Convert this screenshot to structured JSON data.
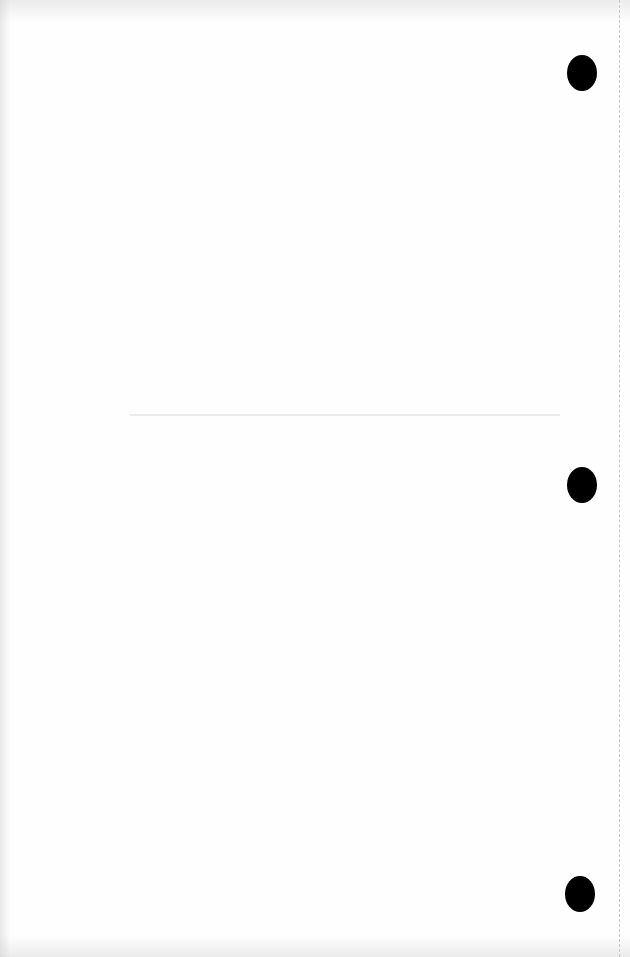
{
  "page": {
    "content": "",
    "background_color": "#fefefe",
    "hole_color": "#000000",
    "punch_holes": [
      {
        "position": "top-right"
      },
      {
        "position": "middle-right"
      },
      {
        "position": "bottom-right"
      }
    ]
  }
}
